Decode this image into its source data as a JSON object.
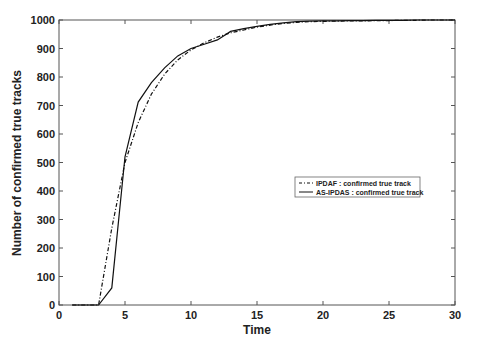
{
  "chart_data": {
    "type": "line",
    "title": "",
    "xlabel": "Time",
    "ylabel": "Number of confirmed true tracks",
    "xlim": [
      0,
      30
    ],
    "ylim": [
      0,
      1000
    ],
    "xticks": [
      0,
      5,
      10,
      15,
      20,
      25,
      30
    ],
    "yticks": [
      0,
      100,
      200,
      300,
      400,
      500,
      600,
      700,
      800,
      900,
      1000
    ],
    "grid": false,
    "legend_position": "center-right",
    "x": [
      1,
      2,
      3,
      4,
      5,
      6,
      7,
      8,
      9,
      10,
      11,
      12,
      13,
      14,
      15,
      16,
      17,
      18,
      19,
      20,
      21,
      22,
      23,
      24,
      25,
      26,
      27,
      28,
      29,
      30
    ],
    "series": [
      {
        "name": "IPDAF : confirmed true track",
        "style": "dash-dot",
        "values": [
          0,
          0,
          0,
          270,
          500,
          640,
          740,
          810,
          860,
          895,
          920,
          940,
          955,
          965,
          975,
          982,
          988,
          992,
          994,
          995,
          996,
          997,
          997,
          998,
          998,
          999,
          999,
          1000,
          1000,
          1000
        ]
      },
      {
        "name": "AS-IPDAS : confirmed true track",
        "style": "solid",
        "values": [
          0,
          0,
          0,
          60,
          520,
          712,
          780,
          832,
          874,
          900,
          915,
          930,
          960,
          970,
          978,
          985,
          990,
          994,
          996,
          997,
          997,
          998,
          998,
          999,
          999,
          999,
          1000,
          1000,
          1000,
          1000
        ]
      }
    ]
  }
}
